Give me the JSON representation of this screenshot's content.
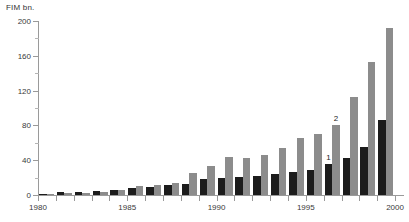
{
  "chart_data": {
    "type": "bar",
    "title": "",
    "subtitle": "",
    "unit_label": "FIM bn.",
    "xlabel": "",
    "ylabel": "FIM bn.",
    "grid": false,
    "legend_position": "none",
    "ylim": [
      0,
      200
    ],
    "yticks": [
      0,
      40,
      80,
      120,
      160,
      200
    ],
    "ytick_labels": [
      "0",
      "40",
      "80",
      "120",
      "160",
      "200"
    ],
    "yticks_minor": [
      20,
      60,
      100,
      140,
      180
    ],
    "xlim": [
      1979.5,
      2000.0
    ],
    "xtick_labels": [
      "1980",
      "1985",
      "1990",
      "1995",
      "2000"
    ],
    "xticks": [
      1980,
      1985,
      1990,
      1995,
      2000
    ],
    "categories": [
      1980,
      1981,
      1982,
      1983,
      1984,
      1985,
      1986,
      1987,
      1988,
      1989,
      1990,
      1991,
      1992,
      1993,
      1994,
      1995,
      1996,
      1997,
      1998,
      1999
    ],
    "series": [
      {
        "name": "1",
        "color": "#1c1c1c",
        "values": [
          1,
          3,
          4,
          5,
          6,
          8,
          9,
          11,
          13,
          18,
          20,
          21,
          22,
          24,
          27,
          29,
          36,
          42,
          55,
          86
        ]
      },
      {
        "name": "2",
        "color": "#8c8c8c",
        "values": [
          1,
          2,
          2,
          3,
          6,
          10,
          12,
          14,
          25,
          33,
          44,
          43,
          46,
          54,
          66,
          70,
          80,
          113,
          153,
          192
        ]
      }
    ],
    "annotations": [
      {
        "text": "1",
        "year": 1996,
        "series": "1",
        "value": 36
      },
      {
        "text": "2",
        "year": 1996,
        "series": "2",
        "value": 80
      }
    ]
  }
}
